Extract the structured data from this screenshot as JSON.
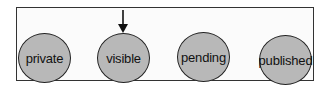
{
  "diagram": {
    "title": "",
    "states": [
      {
        "label": "private",
        "cx": 44,
        "cy": 58
      },
      {
        "label": "visible",
        "cx": 123,
        "cy": 58
      },
      {
        "label": "pending",
        "cx": 203,
        "cy": 57
      },
      {
        "label": "published",
        "cx": 285,
        "cy": 60
      }
    ],
    "initial_state": "visible",
    "colors": {
      "state_fill": "#b8b8b8",
      "border": "#222222",
      "background": "#fbfbfb"
    }
  }
}
